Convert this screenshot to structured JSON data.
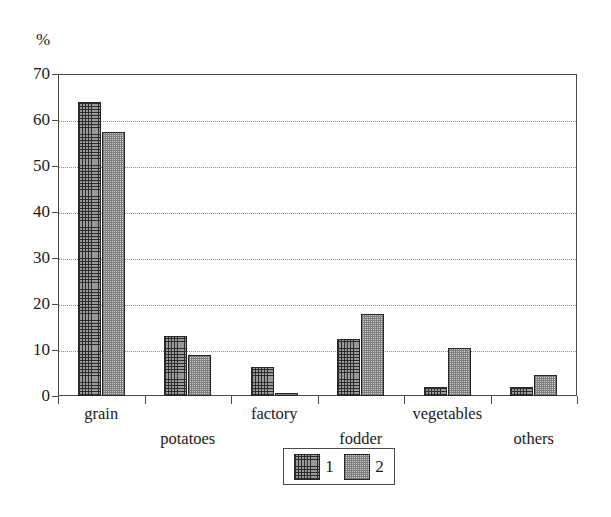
{
  "chart_data": {
    "type": "bar",
    "title": "",
    "xlabel": "",
    "ylabel": "%",
    "ylim": [
      0,
      70
    ],
    "yticks": [
      0,
      10,
      20,
      30,
      40,
      50,
      60,
      70
    ],
    "grid": true,
    "legend_position": "bottom-center",
    "categories": [
      "grain",
      "potatoes",
      "factory",
      "fodder",
      "vegetables",
      "others"
    ],
    "series": [
      {
        "name": "1",
        "values": [
          64.0,
          13.0,
          6.2,
          12.3,
          2.0,
          2.0
        ]
      },
      {
        "name": "2",
        "values": [
          57.5,
          9.0,
          0.3,
          17.8,
          10.4,
          4.5
        ]
      }
    ]
  },
  "axis": {
    "unit_label": "%",
    "tick_labels": [
      "70",
      "60",
      "50",
      "40",
      "30",
      "20",
      "10",
      "0"
    ]
  },
  "legend": {
    "entries": [
      {
        "label": "1",
        "swatch": "series-1-swatch"
      },
      {
        "label": "2",
        "swatch": "series-2-swatch"
      }
    ]
  }
}
